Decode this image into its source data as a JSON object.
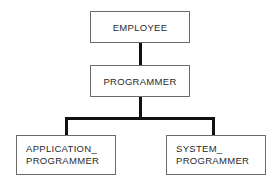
{
  "diagram": {
    "type": "hierarchy",
    "nodes": {
      "employee": {
        "label": "EMPLOYEE"
      },
      "programmer": {
        "label": "PROGRAMMER"
      },
      "application_programmer": {
        "line1": "APPLICATION_",
        "line2": "PROGRAMMER"
      },
      "system_programmer": {
        "line1": "SYSTEM_",
        "line2": "PROGRAMMER"
      }
    },
    "edges": [
      {
        "from": "EMPLOYEE",
        "to": "PROGRAMMER"
      },
      {
        "from": "PROGRAMMER",
        "to": "APPLICATION_PROGRAMMER"
      },
      {
        "from": "PROGRAMMER",
        "to": "SYSTEM_PROGRAMMER"
      }
    ]
  }
}
